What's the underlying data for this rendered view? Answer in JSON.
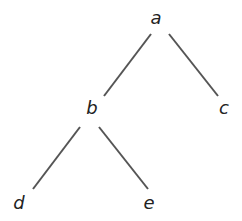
{
  "diagram": {
    "type": "tree",
    "nodes": [
      {
        "id": "a",
        "label": "a",
        "x": 156,
        "y": 24
      },
      {
        "id": "b",
        "label": "b",
        "x": 92,
        "y": 114
      },
      {
        "id": "c",
        "label": "c",
        "x": 224,
        "y": 114
      },
      {
        "id": "d",
        "label": "d",
        "x": 19,
        "y": 209
      },
      {
        "id": "e",
        "label": "e",
        "x": 149,
        "y": 209
      }
    ],
    "edges": [
      {
        "from": "a",
        "to": "b",
        "x1": 151,
        "y1": 34,
        "x2": 104,
        "y2": 96
      },
      {
        "from": "a",
        "to": "c",
        "x1": 169,
        "y1": 34,
        "x2": 218,
        "y2": 96
      },
      {
        "from": "b",
        "to": "d",
        "x1": 80,
        "y1": 127,
        "x2": 33,
        "y2": 189
      },
      {
        "from": "b",
        "to": "e",
        "x1": 99,
        "y1": 127,
        "x2": 148,
        "y2": 189
      }
    ],
    "colors": {
      "edge": "#555555",
      "label": "#222222",
      "background": "#ffffff"
    }
  }
}
